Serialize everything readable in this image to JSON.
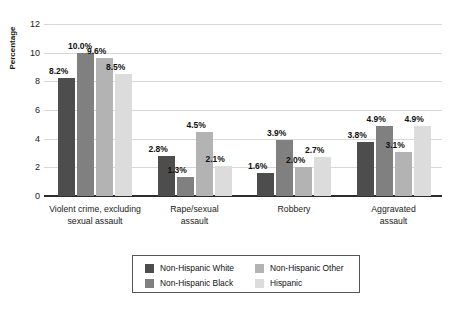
{
  "chart_data": {
    "type": "bar",
    "title": "",
    "subtitle": "",
    "xlabel": "",
    "ylabel": "Percentage",
    "ylim": [
      0,
      12
    ],
    "ytick_step": 2,
    "yticks": [
      "12",
      "10",
      "8",
      "6",
      "4",
      "2",
      "0"
    ],
    "grid": true,
    "grid_axis": "y",
    "legend_position": "bottom",
    "legend_columns": 2,
    "value_label_suffix": "%",
    "categories": [
      "Violent crime, excluding sexual assault",
      "Rape/sexual assault",
      "Robbery",
      "Aggravated assault"
    ],
    "category_lines": [
      [
        "Violent crime, excluding",
        "sexual assault"
      ],
      [
        "Rape/sexual",
        "assault"
      ],
      [
        "Robbery"
      ],
      [
        "Aggravated",
        "assault"
      ]
    ],
    "series": [
      {
        "name": "Non-Hispanic White",
        "color": "#4d4d4d",
        "values": [
          8.2,
          2.8,
          1.6,
          3.8
        ],
        "labels": [
          "8.2%",
          "2.8%",
          "1.6%",
          "3.8%"
        ]
      },
      {
        "name": "Non-Hispanic Black",
        "color": "#808080",
        "values": [
          10.0,
          1.3,
          3.9,
          4.9
        ],
        "labels": [
          "10.0%",
          "1.3%",
          "3.9%",
          "4.9%"
        ]
      },
      {
        "name": "Non-Hispanic Other",
        "color": "#b3b3b3",
        "values": [
          9.6,
          4.5,
          2.0,
          3.1
        ],
        "labels": [
          "9.6%",
          "4.5%",
          "2.0%",
          "3.1%"
        ]
      },
      {
        "name": "Hispanic",
        "color": "#dcdcdc",
        "values": [
          8.5,
          2.1,
          2.7,
          4.9
        ],
        "labels": [
          "8.5%",
          "2.1%",
          "2.7%",
          "4.9%"
        ]
      }
    ]
  }
}
